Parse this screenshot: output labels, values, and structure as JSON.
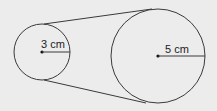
{
  "diagram": {
    "background": "#ececec",
    "stroke": "#3a3a3a",
    "small_circle": {
      "cx": 42,
      "cy": 52,
      "r": 28,
      "radius_label": "3 cm"
    },
    "large_circle": {
      "cx": 158,
      "cy": 56,
      "r": 47,
      "radius_label": "5 cm"
    },
    "tangent_lines": [
      {
        "x1": 44,
        "y1": 24,
        "x2": 152,
        "y2": 9
      },
      {
        "x1": 44,
        "y1": 80,
        "x2": 146,
        "y2": 103
      }
    ]
  }
}
